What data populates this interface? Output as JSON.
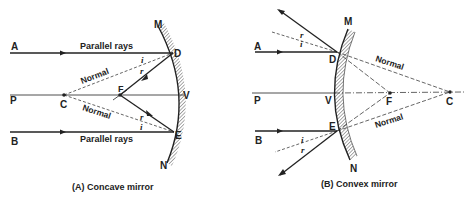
{
  "figure": {
    "panels": [
      {
        "id": "A",
        "caption": "(A) Concave mirror",
        "labels": {
          "ray_top_start": "A",
          "ray_bottom_start": "B",
          "axis_start": "P",
          "center": "C",
          "focus": "F",
          "vertex": "V",
          "incidence_top": "D",
          "incidence_bottom": "E",
          "mirror_top": "M",
          "mirror_bottom": "N",
          "parallel_top": "Parallel rays",
          "parallel_bottom": "Parallel rays",
          "normal_top": "Normal",
          "normal_bottom": "Normal",
          "angle_i_top": "i",
          "angle_r_top": "r",
          "angle_r_bottom": "r",
          "angle_i_bottom": "i"
        }
      },
      {
        "id": "B",
        "caption": "(B) Convex mirror",
        "labels": {
          "ray_top_start": "A",
          "ray_bottom_start": "B",
          "axis_start": "P",
          "vertex": "V",
          "focus": "F",
          "center": "C",
          "incidence_top": "D",
          "incidence_bottom": "E",
          "mirror_top": "M",
          "mirror_bottom": "N",
          "normal_top": "Normal",
          "normal_bottom": "Normal",
          "angle_r_top": "r",
          "angle_i_top": "i",
          "angle_i_bottom": "i",
          "angle_r_bottom": "r"
        }
      }
    ],
    "colors": {
      "ink": "#222222",
      "background": "#ffffff",
      "hatch": "#555555"
    }
  }
}
